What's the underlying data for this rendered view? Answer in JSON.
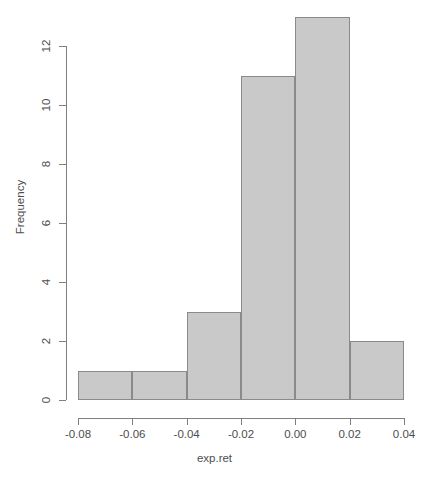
{
  "chart_data": {
    "type": "bar",
    "title": "",
    "subtitle": "",
    "xlabel": "exp.ret",
    "ylabel": "Frequency",
    "grid": false,
    "legend": "none",
    "bin_width": 0.02,
    "bin_edges": [
      -0.08,
      -0.06,
      -0.04,
      -0.02,
      0.0,
      0.02,
      0.04
    ],
    "categories": [
      "[-0.08,-0.06]",
      "(-0.06,-0.04]",
      "(-0.04,-0.02]",
      "(-0.02,0.00]",
      "(0.00,0.02]",
      "(0.02,0.04]"
    ],
    "values": [
      1,
      1,
      3,
      11,
      13,
      2
    ],
    "bins": [
      {
        "label": "[-0.08,-0.06]",
        "x0": -0.08,
        "x1": -0.06,
        "count": 1
      },
      {
        "label": "(-0.06,-0.04]",
        "x0": -0.06,
        "x1": -0.04,
        "count": 1
      },
      {
        "label": "(-0.04,-0.02]",
        "x0": -0.04,
        "x1": -0.02,
        "count": 3
      },
      {
        "label": "(-0.02,0.00]",
        "x0": -0.02,
        "x1": 0.0,
        "count": 11
      },
      {
        "label": "(0.00,0.02]",
        "x0": 0.0,
        "x1": 0.02,
        "count": 13
      },
      {
        "label": "(0.02,0.04]",
        "x0": 0.02,
        "x1": 0.04,
        "count": 2
      }
    ],
    "xlim": [
      -0.08,
      0.04
    ],
    "ylim": [
      0,
      13
    ],
    "xticks": [
      -0.08,
      -0.06,
      -0.04,
      -0.02,
      0.0,
      0.02,
      0.04
    ],
    "xtick_labels": [
      "-0.08",
      "-0.06",
      "-0.04",
      "-0.02",
      "0.00",
      "0.02",
      "0.04"
    ],
    "yticks": [
      0,
      2,
      4,
      6,
      8,
      10,
      12
    ],
    "ytick_labels": [
      "0",
      "2",
      "4",
      "6",
      "8",
      "10",
      "12"
    ],
    "total_count": 31,
    "colors": {
      "bar_fill": "#c9c9c9",
      "bar_border": "#8a8a8a",
      "axis": "#7f7f7f",
      "text": "#4d4d4d",
      "background": "#ffffff"
    }
  }
}
